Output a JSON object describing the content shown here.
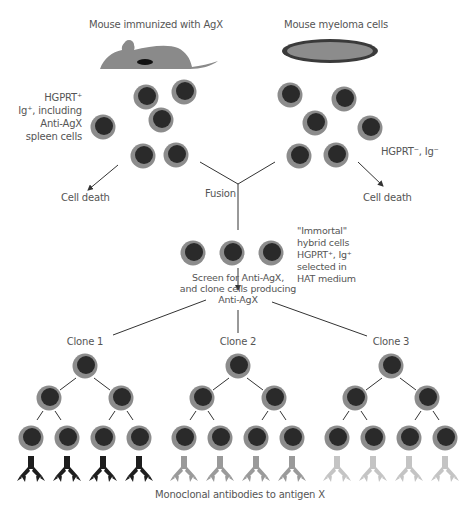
{
  "labels": {
    "mouse_immunized": "Mouse immunized with AgX",
    "myeloma": "Mouse myeloma cells",
    "spleen_cells": [
      "HGPRT⁺",
      "Ig⁺, including",
      "Anti-AgX",
      "spleen cells"
    ],
    "myeloma_phenotype": "HGPRT⁻, Ig⁻",
    "cell_death_left": "Cell death",
    "cell_death_right": "Cell death",
    "fusion": "Fusion",
    "hybrid": [
      "\"Immortal\"",
      "hybrid cells",
      "HGPRT⁺, Ig⁺",
      "selected in",
      "HAT medium"
    ],
    "screen": [
      "Screen for Anti-AgX,",
      "and clone cells producing",
      "Anti-AgX"
    ],
    "clone1": "Clone 1",
    "clone2": "Clone 2",
    "clone3": "Clone 3",
    "caption": "Monoclonal antibodies to antigen X"
  },
  "colors": {
    "cell_outer": "#8c8c8c",
    "cell_nucleus": "#2a2a2a",
    "mouse": "#8a8a8a",
    "myeloma_dish_border": "#3a3a3a",
    "myeloma_dish_fill": "#8c8c8c",
    "antibody_clone1": "#1e1e1e",
    "antibody_clone2": "#9a9a9a",
    "antibody_clone3": "#c4c4c4",
    "text": "#555555",
    "lines": "#333333"
  },
  "cells": {
    "spleen": [
      [
        146,
        97
      ],
      [
        184,
        92
      ],
      [
        103,
        127
      ],
      [
        161,
        120
      ],
      [
        143,
        156
      ],
      [
        176,
        155
      ]
    ],
    "myeloma": [
      [
        290,
        95
      ],
      [
        344,
        99
      ],
      [
        315,
        123
      ],
      [
        370,
        128
      ],
      [
        299,
        156
      ],
      [
        336,
        155
      ]
    ],
    "hybrid": [
      [
        193,
        253
      ],
      [
        232,
        253
      ],
      [
        271,
        253
      ]
    ]
  },
  "clones": [
    {
      "x": 85,
      "antibody_color_key": "antibody_clone1"
    },
    {
      "x": 238,
      "antibody_color_key": "antibody_clone2"
    },
    {
      "x": 391,
      "antibody_color_key": "antibody_clone3"
    }
  ]
}
